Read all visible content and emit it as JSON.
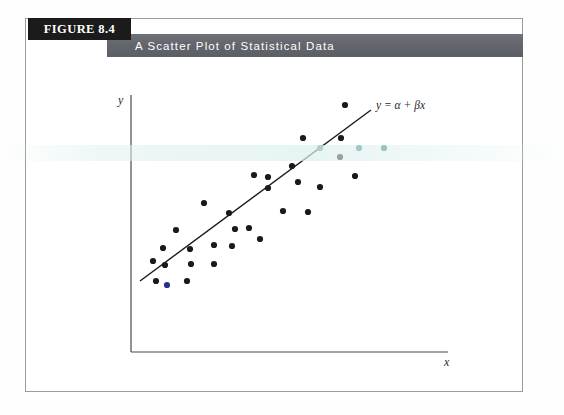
{
  "figure": {
    "tag_label": "FIGURE 8.4",
    "caption": "A Scatter Plot of Statistical Data"
  },
  "colors": {
    "tag_background": "#1b1b1b",
    "caption_background": "#63666c",
    "frame_border": "#9b9b9b",
    "axis": "#4a4a4a",
    "point": "#1a1a1a",
    "point_tinted": "#4f8a82",
    "point_blue": "#2e2e8f",
    "regression_line": "#1a1a1a"
  },
  "chart_data": {
    "type": "scatter",
    "title": "A Scatter Plot of Statistical Data",
    "xlabel": "x",
    "ylabel": "y",
    "grid": false,
    "legend": null,
    "annotations": [
      {
        "text": "y = α + βx",
        "x": 376,
        "y": 109
      }
    ],
    "axes": {
      "y_axis": {
        "x": 131,
        "y_top": 95,
        "y_bottom": 352
      },
      "x_axis": {
        "y": 352,
        "x_left": 131,
        "x_right": 448
      }
    },
    "regression_line": {
      "x1": 140,
      "y1": 281,
      "x2": 371,
      "y2": 110
    },
    "points": [
      {
        "x": 345,
        "y": 105,
        "color": "#1a1a1a"
      },
      {
        "x": 303,
        "y": 138,
        "color": "#1a1a1a"
      },
      {
        "x": 341,
        "y": 138,
        "color": "#1a1a1a"
      },
      {
        "x": 320,
        "y": 148,
        "color": "#4f8a82"
      },
      {
        "x": 359,
        "y": 148,
        "color": "#4f8a82"
      },
      {
        "x": 384,
        "y": 148,
        "color": "#4f8a82"
      },
      {
        "x": 340,
        "y": 157,
        "color": "#1a1a1a"
      },
      {
        "x": 292,
        "y": 166,
        "color": "#1a1a1a"
      },
      {
        "x": 254,
        "y": 175,
        "color": "#1a1a1a"
      },
      {
        "x": 355,
        "y": 176,
        "color": "#1a1a1a"
      },
      {
        "x": 268,
        "y": 177,
        "color": "#1a1a1a"
      },
      {
        "x": 298,
        "y": 182,
        "color": "#1a1a1a"
      },
      {
        "x": 268,
        "y": 188,
        "color": "#1a1a1a"
      },
      {
        "x": 320,
        "y": 187,
        "color": "#1a1a1a"
      },
      {
        "x": 204,
        "y": 203,
        "color": "#1a1a1a"
      },
      {
        "x": 283,
        "y": 211,
        "color": "#1a1a1a"
      },
      {
        "x": 308,
        "y": 212,
        "color": "#1a1a1a"
      },
      {
        "x": 229,
        "y": 213,
        "color": "#1a1a1a"
      },
      {
        "x": 249,
        "y": 228,
        "color": "#1a1a1a"
      },
      {
        "x": 235,
        "y": 229,
        "color": "#1a1a1a"
      },
      {
        "x": 176,
        "y": 230,
        "color": "#1a1a1a"
      },
      {
        "x": 260,
        "y": 239,
        "color": "#1a1a1a"
      },
      {
        "x": 214,
        "y": 245,
        "color": "#1a1a1a"
      },
      {
        "x": 232,
        "y": 246,
        "color": "#1a1a1a"
      },
      {
        "x": 190,
        "y": 249,
        "color": "#1a1a1a"
      },
      {
        "x": 163,
        "y": 248,
        "color": "#1a1a1a"
      },
      {
        "x": 153,
        "y": 261,
        "color": "#1a1a1a"
      },
      {
        "x": 191,
        "y": 264,
        "color": "#1a1a1a"
      },
      {
        "x": 214,
        "y": 264,
        "color": "#1a1a1a"
      },
      {
        "x": 165,
        "y": 265,
        "color": "#1a1a1a"
      },
      {
        "x": 156,
        "y": 281,
        "color": "#1a1a1a"
      },
      {
        "x": 187,
        "y": 281,
        "color": "#1a1a1a"
      },
      {
        "x": 167,
        "y": 285,
        "color": "#2e2e8f"
      }
    ]
  }
}
